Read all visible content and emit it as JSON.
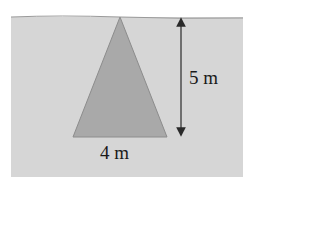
{
  "diagram": {
    "colors": {
      "background": "#ffffff",
      "water": "#d6d6d6",
      "water_surface": "#9a9a9a",
      "triangle_fill": "#a9a9a9",
      "triangle_stroke": "#8c8c8c",
      "arrow": "#2a2a2a",
      "text": "#1a1a1a"
    },
    "water": {
      "x": 11,
      "y": 17,
      "width": 232,
      "height": 160
    },
    "triangle": {
      "apex": [
        120,
        17
      ],
      "base_left": [
        73,
        137
      ],
      "base_right": [
        167,
        137
      ]
    },
    "dimension_arrow": {
      "x": 181,
      "y_top": 17,
      "y_bottom": 137
    },
    "labels": {
      "height": "5 m",
      "base": "4 m"
    }
  }
}
